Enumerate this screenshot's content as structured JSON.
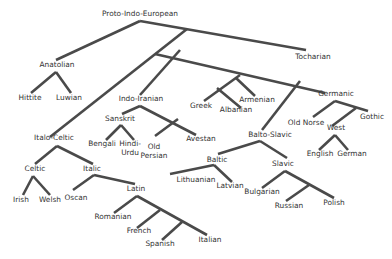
{
  "diagram": {
    "line_color": "#4a4a4a",
    "text_color": "#333333",
    "nodes": [
      {
        "id": "pie",
        "label": "Proto-Indo-European",
        "x": 140,
        "y": 16
      },
      {
        "id": "anatolian",
        "label": "Anatolian",
        "x": 57,
        "y": 67
      },
      {
        "id": "hittite",
        "label": "Hittite",
        "x": 30,
        "y": 100
      },
      {
        "id": "luwian",
        "label": "Luwian",
        "x": 69,
        "y": 100
      },
      {
        "id": "tocharian",
        "label": "Tocharian",
        "x": 313,
        "y": 59
      },
      {
        "id": "indo_iranian",
        "label": "Indo-Iranian",
        "x": 141,
        "y": 101
      },
      {
        "id": "sanskrit",
        "label": "Sanskrit",
        "x": 120,
        "y": 121
      },
      {
        "id": "bengali",
        "label": "Bengali",
        "x": 102,
        "y": 146
      },
      {
        "id": "hindi_urdu",
        "label": "Hindi-",
        "label2": "Urdu",
        "x": 130,
        "y": 146
      },
      {
        "id": "old_persian",
        "label": "Old",
        "label2": "Persian",
        "x": 154,
        "y": 149
      },
      {
        "id": "avestan",
        "label": "Avestan",
        "x": 201,
        "y": 141
      },
      {
        "id": "greek",
        "label": "Greek",
        "x": 201,
        "y": 108
      },
      {
        "id": "albanian",
        "label": "Albanian",
        "x": 236,
        "y": 112
      },
      {
        "id": "armenian",
        "label": "Armenian",
        "x": 257,
        "y": 102
      },
      {
        "id": "germanic",
        "label": "Germanic",
        "x": 336,
        "y": 96
      },
      {
        "id": "old_norse",
        "label": "Old Norse",
        "x": 306,
        "y": 125
      },
      {
        "id": "gothic",
        "label": "Gothic",
        "x": 372,
        "y": 119
      },
      {
        "id": "west",
        "label": "West",
        "x": 336,
        "y": 130
      },
      {
        "id": "english",
        "label": "English",
        "x": 320,
        "y": 156
      },
      {
        "id": "german",
        "label": "German",
        "x": 352,
        "y": 156
      },
      {
        "id": "balto_slavic",
        "label": "Balto-Slavic",
        "x": 270,
        "y": 137
      },
      {
        "id": "baltic",
        "label": "Baltic",
        "x": 217,
        "y": 162
      },
      {
        "id": "lithuanian",
        "label": "Lithuanian",
        "x": 196,
        "y": 182
      },
      {
        "id": "latvian",
        "label": "Latvian",
        "x": 230,
        "y": 188
      },
      {
        "id": "slavic",
        "label": "Slavic",
        "x": 283,
        "y": 166
      },
      {
        "id": "bulgarian",
        "label": "Bulgarian",
        "x": 262,
        "y": 194
      },
      {
        "id": "russian",
        "label": "Russian",
        "x": 289,
        "y": 208
      },
      {
        "id": "polish",
        "label": "Polish",
        "x": 334,
        "y": 205
      },
      {
        "id": "italo_celtic",
        "label": "Italo-Celtic",
        "x": 54,
        "y": 140
      },
      {
        "id": "celtic",
        "label": "Celtic",
        "x": 35,
        "y": 171
      },
      {
        "id": "irish",
        "label": "Irish",
        "x": 21,
        "y": 202
      },
      {
        "id": "welsh",
        "label": "Welsh",
        "x": 50,
        "y": 202
      },
      {
        "id": "italic",
        "label": "Italic",
        "x": 92,
        "y": 171
      },
      {
        "id": "oscan",
        "label": "Oscan",
        "x": 76,
        "y": 200
      },
      {
        "id": "latin",
        "label": "Latin",
        "x": 136,
        "y": 191
      },
      {
        "id": "romanian",
        "label": "Romanian",
        "x": 113,
        "y": 219
      },
      {
        "id": "french",
        "label": "French",
        "x": 139,
        "y": 233
      },
      {
        "id": "spanish",
        "label": "Spanish",
        "x": 160,
        "y": 246
      },
      {
        "id": "italian",
        "label": "Italian",
        "x": 210,
        "y": 242
      }
    ],
    "edges": [
      [
        140,
        21,
        56,
        60
      ],
      [
        140,
        21,
        306,
        50
      ],
      [
        187,
        29,
        50,
        137
      ],
      [
        155,
        54,
        325,
        93
      ],
      [
        180,
        50,
        140,
        95
      ],
      [
        56,
        72,
        31,
        93
      ],
      [
        56,
        72,
        71,
        93
      ],
      [
        240,
        75,
        204,
        101
      ],
      [
        217,
        88,
        241,
        108
      ],
      [
        236,
        78,
        255,
        96
      ],
      [
        300,
        81,
        262,
        130
      ],
      [
        140,
        106,
        122,
        114
      ],
      [
        140,
        106,
        196,
        135
      ],
      [
        121,
        125,
        106,
        140
      ],
      [
        121,
        125,
        134,
        140
      ],
      [
        178,
        119,
        155,
        136
      ],
      [
        335,
        101,
        313,
        117
      ],
      [
        335,
        101,
        368,
        111
      ],
      [
        356,
        108,
        332,
        126
      ],
      [
        335,
        135,
        319,
        150
      ],
      [
        335,
        135,
        348,
        150
      ],
      [
        260,
        141,
        218,
        154
      ],
      [
        260,
        141,
        287,
        158
      ],
      [
        214,
        165,
        170,
        174
      ],
      [
        214,
        165,
        232,
        182
      ],
      [
        285,
        171,
        262,
        188
      ],
      [
        285,
        171,
        334,
        198
      ],
      [
        309,
        185,
        286,
        201
      ],
      [
        57,
        146,
        35,
        164
      ],
      [
        57,
        146,
        93,
        164
      ],
      [
        33,
        176,
        23,
        195
      ],
      [
        33,
        176,
        50,
        195
      ],
      [
        94,
        175,
        73,
        190
      ],
      [
        94,
        175,
        135,
        184
      ],
      [
        137,
        196,
        114,
        213
      ],
      [
        137,
        196,
        207,
        235
      ],
      [
        160,
        210,
        137,
        228
      ],
      [
        182,
        222,
        162,
        240
      ]
    ]
  }
}
